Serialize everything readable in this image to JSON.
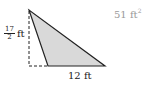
{
  "diagram": {
    "answer": {
      "value": "51 ft",
      "exponent": "2"
    },
    "height_label": {
      "numerator": "17",
      "denominator": "2",
      "unit": "ft"
    },
    "base_label": "12 ft",
    "colors": {
      "fill": "#d9d9d9",
      "stroke": "#222222",
      "answer_text": "#9a9a9a"
    }
  }
}
